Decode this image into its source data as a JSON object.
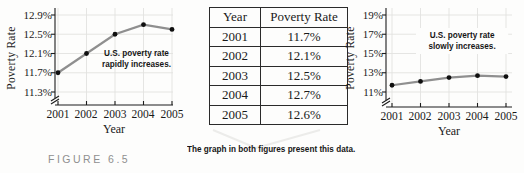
{
  "figure_label": "FIGURE 6.5",
  "caption": "The graph in both figures present this data.",
  "table": {
    "headers": [
      "Year",
      "Poverty Rate"
    ],
    "rows": [
      [
        "2001",
        "11.7%"
      ],
      [
        "2002",
        "12.1%"
      ],
      [
        "2003",
        "12.5%"
      ],
      [
        "2004",
        "12.7%"
      ],
      [
        "2005",
        "12.6%"
      ]
    ]
  },
  "chart_data": [
    {
      "type": "line",
      "title": "",
      "x": [
        2001,
        2002,
        2003,
        2004,
        2005
      ],
      "values": [
        11.7,
        12.1,
        12.5,
        12.7,
        12.6
      ],
      "xlabel": "Year",
      "ylabel": "Poverty Rate",
      "xticks": [
        "2001",
        "2002",
        "2003",
        "2004",
        "2005"
      ],
      "yticks": [
        "12.9%",
        "12.5%",
        "12.1%",
        "11.7%",
        "11.3%"
      ],
      "ytick_values": [
        12.9,
        12.5,
        12.1,
        11.7,
        11.3
      ],
      "ylim": [
        11.3,
        12.9
      ],
      "axis_break": true,
      "grid": true,
      "legend_position": "none",
      "annotation": "U.S. poverty rate rapidly increases.",
      "annotation_line1": "U.S. poverty rate",
      "annotation_line2": "rapidly increases."
    },
    {
      "type": "line",
      "title": "",
      "x": [
        2001,
        2002,
        2003,
        2004,
        2005
      ],
      "values": [
        11.7,
        12.1,
        12.5,
        12.7,
        12.6
      ],
      "xlabel": "Year",
      "ylabel": "Poverty Rate",
      "xticks": [
        "2001",
        "2002",
        "2003",
        "2004",
        "2005"
      ],
      "yticks": [
        "19%",
        "17%",
        "15%",
        "13%",
        "11%"
      ],
      "ytick_values": [
        19,
        17,
        15,
        13,
        11
      ],
      "ylim": [
        11,
        19
      ],
      "axis_break": true,
      "grid": true,
      "legend_position": "none",
      "annotation": "U.S. poverty rate slowly increases.",
      "annotation_line1": "U.S. poverty rate",
      "annotation_line2": "slowly increases."
    }
  ],
  "colors": {
    "line": "#8f8f8f",
    "marker": "#0f0f0f",
    "grid": "#e2e2e0",
    "axis": "#1c1c1c",
    "figure_label": "#8f8f8f"
  }
}
